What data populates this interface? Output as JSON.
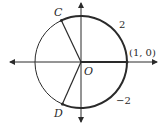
{
  "diagram": {
    "colors": {
      "stroke": "#2a2a2a",
      "background": "#ffffff"
    },
    "center": {
      "label": "O"
    },
    "points": [
      {
        "label": "C",
        "position": "upper-left on circle"
      },
      {
        "label": "D",
        "position": "lower-left on circle"
      },
      {
        "label": "(1, 0)",
        "position": "right intersection with x-axis"
      }
    ],
    "arc_labels": [
      {
        "label": "2",
        "position": "upper-right, arc length counterclockwise to C"
      },
      {
        "label": "−2",
        "position": "lower-right, arc length clockwise to D"
      }
    ]
  }
}
